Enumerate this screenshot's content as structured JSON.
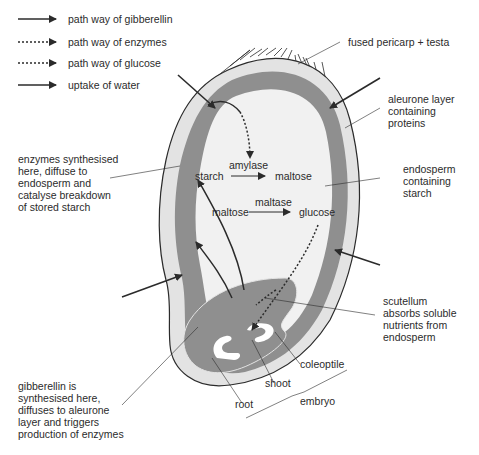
{
  "colors": {
    "background": "#ffffff",
    "outer_layer": "#e3e3e3",
    "aleurone": "#8f8f8f",
    "endosperm": "#f1f1f1",
    "embryo": "#8f8f8f",
    "line": "#2b2b2b"
  },
  "legend": [
    {
      "style": "solid",
      "label": "path way of gibberellin"
    },
    {
      "style": "dotted",
      "label": "path way of enzymes"
    },
    {
      "style": "dotted",
      "label": "path way of glucose"
    },
    {
      "style": "solid",
      "label": "uptake of water"
    }
  ],
  "labels": {
    "pericarp": "fused pericarp + testa",
    "aleurone": "aleurone layer\ncontaining\nproteins",
    "enzymes": "enzymes synthesised\nhere, diffuse to\nendosperm and\ncatalyse breakdown\nof stored starch",
    "endosperm": "endosperm\ncontaining\nstarch",
    "scutellum": "scutellum\nabsorbs soluble\nnutrients from\nendosperm",
    "gibberellin": "gibberellin is\nsynthesised here,\ndiffuses to aleurone\nlayer and triggers\nproduction of enzymes",
    "coleoptile": "coleoptile",
    "shoot": "shoot",
    "root": "root",
    "embryo": "embryo"
  },
  "reactions": {
    "r1": {
      "substrate": "starch",
      "enzyme": "amylase",
      "product": "maltose"
    },
    "r2": {
      "substrate": "maltose",
      "enzyme": "maltase",
      "product": "glucose"
    }
  }
}
